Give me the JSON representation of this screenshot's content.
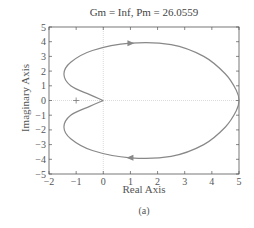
{
  "chart_data": {
    "type": "line",
    "title": "Gm = Inf, Pm = 26.0559",
    "xlabel": "Real Axis",
    "ylabel": "Imaginary Axis",
    "caption": "(a)",
    "xlim": [
      -2,
      5
    ],
    "ylim": [
      -5,
      5
    ],
    "xticks": [
      "−2",
      "−1",
      "0",
      "1",
      "2",
      "3",
      "4",
      "5"
    ],
    "yticks": [
      "5",
      "4",
      "3",
      "2",
      "1",
      "0",
      "−1",
      "−2",
      "−3",
      "−4",
      "−5"
    ],
    "grid": false,
    "critical_point": {
      "x": -1,
      "y": 0,
      "marker": "+"
    },
    "series": [
      {
        "name": "Nyquist plot",
        "color": "#888888",
        "points_upper": [
          [
            0,
            0
          ],
          [
            -0.5,
            0.4
          ],
          [
            -1.2,
            1.0
          ],
          [
            -1.45,
            1.8
          ],
          [
            -1.2,
            2.6
          ],
          [
            -0.4,
            3.4
          ],
          [
            1,
            3.9
          ],
          [
            2.5,
            3.8
          ],
          [
            3.7,
            3.0
          ],
          [
            4.5,
            1.8
          ],
          [
            4.9,
            0.7
          ],
          [
            5,
            0
          ]
        ],
        "points_lower": [
          [
            5,
            0
          ],
          [
            4.9,
            -0.7
          ],
          [
            4.5,
            -1.8
          ],
          [
            3.7,
            -3.0
          ],
          [
            2.5,
            -3.8
          ],
          [
            1,
            -3.9
          ],
          [
            -0.4,
            -3.4
          ],
          [
            -1.2,
            -2.6
          ],
          [
            -1.45,
            -1.8
          ],
          [
            -1.2,
            -1.0
          ],
          [
            -0.5,
            -0.4
          ],
          [
            0,
            0
          ]
        ],
        "arrows": [
          {
            "x": 1,
            "y": 3.9,
            "dir": "right"
          },
          {
            "x": 1,
            "y": -3.9,
            "dir": "left"
          }
        ]
      }
    ]
  }
}
